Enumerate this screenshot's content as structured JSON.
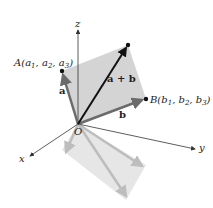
{
  "figure": {
    "type": "3d-vector-addition-diagram",
    "axes": {
      "x_label": "x",
      "y_label": "y",
      "z_label": "z",
      "origin_label": "O"
    },
    "points": {
      "A": {
        "name": "A",
        "coords": [
          "a",
          "a",
          "a"
        ],
        "label_prefix": "A(",
        "c1": "a",
        "s1": "1",
        "c2": "a",
        "s2": "2",
        "c3": "a",
        "s3": "3"
      },
      "B": {
        "name": "B",
        "label_prefix": "B(",
        "c1": "b",
        "s1": "1",
        "c2": "b",
        "s2": "2",
        "c3": "b",
        "s3": "3"
      }
    },
    "vectors": {
      "a_label": "a",
      "b_label": "b",
      "sum_label": "a + b"
    },
    "colors": {
      "parallelogram_fill": "#d4d4d4",
      "shadow_fill": "#e6e6e6",
      "vector_gray": "#6b6b6b",
      "sum_vector": "#111111",
      "axis": "#333333",
      "shadow_arrow": "#bdbdbd"
    }
  }
}
